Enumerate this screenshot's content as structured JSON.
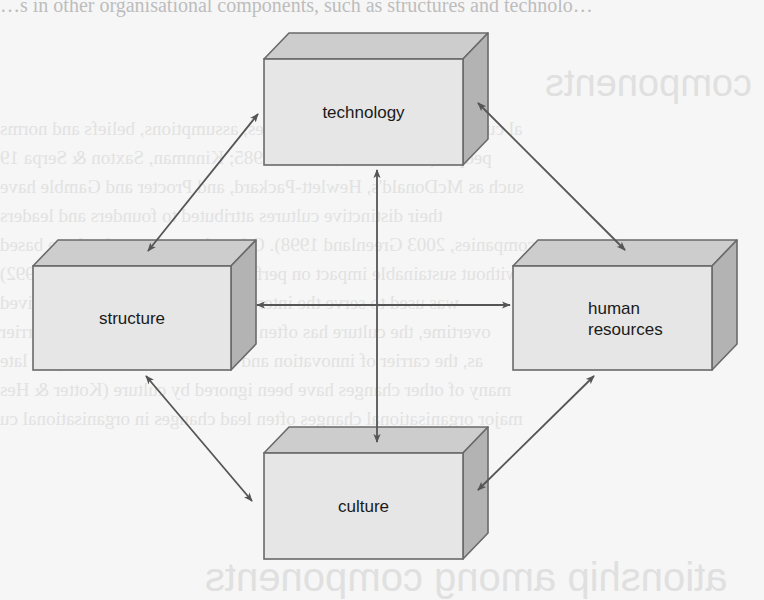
{
  "background": {
    "top_line": "…s in other organisational components, such as structures and technolo…",
    "show_through_heading_1": "components",
    "show_through_paragraph": [
      "al culture is system of shared values, assumptions, beliefs and norms",
      "people (Starke 1995; Schein 1985; Kinnman, Saxton & Serpa 19",
      "such as McDonald's, Hewlett-Packard, and Procter and Gamble have",
      "their distinctive cultures attributed to founders and leaders",
      "companies, 2003 Greenland 1998). Others have changed culture based",
      "leadership, without sustainable impact on performance (Kotter & Heskett 1992)",
      "was used to serve the interests of customers, often perceived",
      "overtime, the culture has often become the major cultural barrier",
      "as, the carrier of innovation and became a major hold-up of late",
      "many of other changes have been ignored by culture (Kotter & Hes",
      "major organisational changes often lead changes in organisational cu"
    ],
    "show_through_heading_2": "ationship among components"
  },
  "diagram": {
    "colors": {
      "front": "#e6e6e6",
      "top": "#cdcdcd",
      "side": "#b3b3b3",
      "border": "#6a6a6a",
      "arrow": "#555555"
    },
    "boxes": [
      {
        "id": "technology",
        "label_lines": [
          "technology"
        ],
        "x": 264,
        "y": 59,
        "w": 199,
        "h": 106,
        "dx": 25,
        "dy": 26
      },
      {
        "id": "structure",
        "label_lines": [
          "structure"
        ],
        "x": 33,
        "y": 266,
        "w": 198,
        "h": 104,
        "dx": 25,
        "dy": 26
      },
      {
        "id": "human-resources",
        "label_lines": [
          "human",
          "resources"
        ],
        "x": 513,
        "y": 266,
        "w": 199,
        "h": 104,
        "dx": 25,
        "dy": 26
      },
      {
        "id": "culture",
        "label_lines": [
          "culture"
        ],
        "x": 264,
        "y": 453,
        "w": 199,
        "h": 106,
        "dx": 25,
        "dy": 26
      }
    ],
    "arrows": [
      {
        "id": "technology-structure",
        "from": [
          258,
          114
        ],
        "to": [
          148,
          251
        ],
        "double": true
      },
      {
        "id": "technology-human-resources",
        "from": [
          478,
          103
        ],
        "to": [
          625,
          250
        ],
        "double": true
      },
      {
        "id": "structure-culture",
        "from": [
          146,
          376
        ],
        "to": [
          252,
          501
        ],
        "double": true
      },
      {
        "id": "human-resources-culture",
        "from": [
          594,
          376
        ],
        "to": [
          478,
          490
        ],
        "double": true
      },
      {
        "id": "technology-culture",
        "from": [
          377,
          170
        ],
        "to": [
          377,
          442
        ],
        "double": true
      },
      {
        "id": "structure-human-resources",
        "from": [
          257,
          305
        ],
        "to": [
          510,
          305
        ],
        "double": true
      }
    ]
  }
}
